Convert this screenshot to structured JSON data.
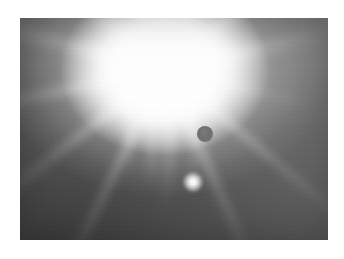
{
  "page": {
    "width": 344,
    "height": 259,
    "background_color": "#ffffff",
    "caption": ""
  },
  "photo": {
    "name": "sun-glare-photograph",
    "subject": "Bright sun with intense glare and lens-flare artifacts",
    "color_mode": "grayscale",
    "frame": {
      "x": 20,
      "y": 18,
      "width": 308,
      "height": 222
    },
    "background": {
      "description": "Gradient sky, mid-gray upper right fading to dark gray lower left",
      "top_right_color": "#7d7d7d",
      "mid_color": "#606060",
      "bottom_left_color": "#474747"
    },
    "sun": {
      "label": "sun-core",
      "center_x_pct": 47,
      "center_y_pct": 23,
      "core_color": "#ffffff",
      "halo_color": "#f2f2f2",
      "ray_count": 14
    },
    "artifacts": [
      {
        "label": "dark-circular-spot",
        "type": "lens-ghost-dark",
        "x": 197,
        "y": 126,
        "diameter": 16,
        "color": "#6f6f6f"
      },
      {
        "label": "bright-flare-dot",
        "type": "lens-flare-bright",
        "x": 183,
        "y": 172,
        "diameter": 20,
        "color": "#ffffff"
      }
    ],
    "streaks": [
      {
        "left_pct": 34,
        "top_pct": 26,
        "width": 9,
        "height": 96
      },
      {
        "left_pct": 41,
        "top_pct": 30,
        "width": 11,
        "height": 104
      },
      {
        "left_pct": 48,
        "top_pct": 28,
        "width": 8,
        "height": 112
      },
      {
        "left_pct": 55,
        "top_pct": 32,
        "width": 10,
        "height": 88
      },
      {
        "left_pct": 60,
        "top_pct": 27,
        "width": 7,
        "height": 74
      }
    ],
    "ray_angles": [
      0,
      26,
      52,
      78,
      104,
      130,
      156,
      180,
      206,
      232,
      258,
      284,
      310,
      336
    ]
  }
}
